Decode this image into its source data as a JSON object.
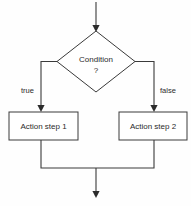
{
  "diagram": {
    "type": "flowchart",
    "background_color": "#fefefe",
    "line_color": "#3a3a3a",
    "text_color": "#2b2b2b",
    "nodes": {
      "decision": {
        "shape": "diamond",
        "label_line1": "Condition",
        "label_line2": "?"
      },
      "action_left": {
        "shape": "rectangle",
        "label": "Action step 1"
      },
      "action_right": {
        "shape": "rectangle",
        "label": "Action step 2"
      }
    },
    "edges": {
      "true_label": "true",
      "false_label": "false"
    }
  }
}
